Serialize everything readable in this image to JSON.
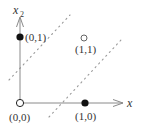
{
  "diagram": {
    "type": "xor-separation-plot",
    "axes": {
      "x_label": "x",
      "y_label": "x",
      "y_label_subscript": "2",
      "axis_color": "#888888"
    },
    "points": [
      {
        "label": "(0,0)",
        "x": 0,
        "y": 0,
        "marker": "open",
        "color": "#222222"
      },
      {
        "label": "(0,1)",
        "x": 0,
        "y": 1,
        "marker": "filled",
        "color": "#111111"
      },
      {
        "label": "(1,1)",
        "x": 1,
        "y": 1,
        "marker": "open",
        "color": "#444444"
      },
      {
        "label": "(1,0)",
        "x": 1,
        "y": 0,
        "marker": "filled",
        "color": "#111111"
      }
    ],
    "separators": [
      {
        "name": "upper-decision-line",
        "style": "dotted",
        "color": "#999999"
      },
      {
        "name": "lower-decision-line",
        "style": "dotted",
        "color": "#999999"
      }
    ]
  }
}
